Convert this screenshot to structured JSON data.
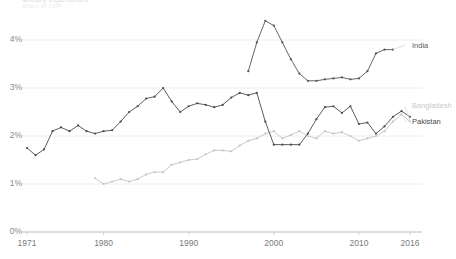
{
  "chart_data": {
    "type": "line",
    "title": "Military expenditure",
    "subtitle": "Share of GDP",
    "xlabel": "",
    "ylabel": "",
    "xlim": [
      1971,
      2016
    ],
    "ylim": [
      0,
      4.6
    ],
    "grid": true,
    "legend_position": "right-inline",
    "x_ticks": [
      "1971",
      "1980",
      "1990",
      "2000",
      "2010",
      "2016"
    ],
    "x_tick_values": [
      1971,
      1980,
      1990,
      2000,
      2010,
      2016
    ],
    "y_ticks": [
      "0%",
      "1%",
      "2%",
      "3%",
      "4%"
    ],
    "y_tick_values": [
      0,
      1,
      2,
      3,
      4
    ],
    "series": [
      {
        "name": "India",
        "color": "#555555",
        "x": [
          1997,
          1998,
          1999,
          2000,
          2001,
          2002,
          2003,
          2004,
          2005,
          2006,
          2007,
          2008,
          2009,
          2010,
          2011,
          2012,
          2013,
          2014
        ],
        "values": [
          3.35,
          3.95,
          4.4,
          4.3,
          3.95,
          3.6,
          3.3,
          3.15,
          3.15,
          3.18,
          3.2,
          3.22,
          3.18,
          3.2,
          3.35,
          3.72,
          3.8,
          3.8
        ]
      },
      {
        "name": "Bangladesh",
        "color": "#c4c4c4",
        "x": [
          1979,
          1980,
          1981,
          1982,
          1983,
          1984,
          1985,
          1986,
          1987,
          1988,
          1989,
          1990,
          1991,
          1992,
          1993,
          1994,
          1995,
          1996,
          1997,
          1998,
          1999,
          2000,
          2001,
          2002,
          2003,
          2004,
          2005,
          2006,
          2007,
          2008,
          2009,
          2010,
          2011,
          2012,
          2013,
          2014,
          2015,
          2016
        ],
        "values": [
          1.12,
          1.0,
          1.05,
          1.1,
          1.05,
          1.1,
          1.2,
          1.25,
          1.25,
          1.4,
          1.45,
          1.5,
          1.52,
          1.62,
          1.7,
          1.7,
          1.68,
          1.8,
          1.9,
          1.95,
          2.05,
          2.1,
          1.95,
          2.02,
          2.1,
          2.0,
          1.95,
          2.1,
          2.05,
          2.08,
          2.0,
          1.9,
          1.95,
          2.0,
          2.1,
          2.3,
          2.45,
          2.3
        ]
      },
      {
        "name": "Pakistan",
        "color": "#4a4a4a",
        "x": [
          1971,
          1972,
          1973,
          1974,
          1975,
          1976,
          1977,
          1978,
          1979,
          1980,
          1981,
          1982,
          1983,
          1984,
          1985,
          1986,
          1987,
          1988,
          1989,
          1990,
          1991,
          1992,
          1993,
          1994,
          1995,
          1996,
          1997,
          1998,
          1999,
          2000,
          2001,
          2002,
          2003,
          2004,
          2005,
          2006,
          2007,
          2008,
          2009,
          2010,
          2011,
          2012,
          2013,
          2014,
          2015,
          2016
        ],
        "values": [
          1.75,
          1.6,
          1.72,
          2.1,
          2.18,
          2.1,
          2.22,
          2.1,
          2.05,
          2.1,
          2.12,
          2.3,
          2.5,
          2.62,
          2.78,
          2.82,
          3.0,
          2.72,
          2.5,
          2.62,
          2.68,
          2.65,
          2.6,
          2.65,
          2.8,
          2.9,
          2.85,
          2.9,
          2.3,
          1.82,
          1.82,
          1.82,
          1.82,
          2.05,
          2.35,
          2.6,
          2.62,
          2.48,
          2.62,
          2.25,
          2.28,
          2.05,
          2.2,
          2.4,
          2.52,
          2.4
        ]
      }
    ]
  },
  "labels": {
    "india": "India",
    "bangladesh": "Bangladesh",
    "pakistan": "Pakistan"
  }
}
